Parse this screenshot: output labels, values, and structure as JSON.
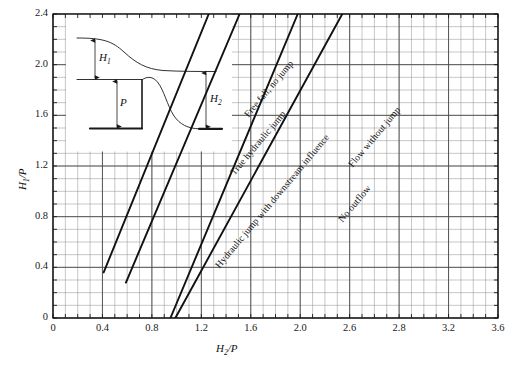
{
  "figure": {
    "background": "#ffffff",
    "line_color": "#1a1a1a",
    "major_grid_color": "#4d4d4d",
    "minor_grid_color": "#8c8c8c"
  },
  "chart_data": {
    "type": "line",
    "title": "",
    "subtitle": "",
    "xlabel": "H2/P",
    "ylabel": "H1/P",
    "xlabel_parts": {
      "base": "H",
      "sub": "2",
      "tail": "/P"
    },
    "ylabel_parts": {
      "base": "H",
      "sub": "1",
      "tail": "/P"
    },
    "xlim": [
      0,
      3.6
    ],
    "ylim": [
      0,
      2.4
    ],
    "xticks": [
      0,
      0.4,
      0.8,
      1.2,
      1.6,
      2.0,
      2.4,
      2.8,
      3.2,
      3.6
    ],
    "xticklabels": [
      "0",
      "0.4",
      "0.8",
      "1.2",
      "1.6",
      "2.0",
      "2.6",
      "2.8",
      "3.2",
      "3.6"
    ],
    "yticks": [
      0,
      0.4,
      0.8,
      1.2,
      1.6,
      2.0,
      2.4
    ],
    "yticklabels": [
      "0",
      "0.4",
      "0.8",
      "1.2",
      "1.6",
      "2.0",
      "2.4"
    ],
    "x_minor_step": 0.1,
    "y_minor_step": 0.1,
    "grid": true,
    "grid_style": "major and minor rectangular grid",
    "legend": "none (curves labelled in-place along the lines)",
    "series": [
      {
        "name": "boundary-1",
        "label_above": "Free fall, no jump",
        "points": [
          [
            0.41,
            0.36
          ],
          [
            1.26,
            2.4
          ]
        ],
        "slope": 2.4
      },
      {
        "name": "boundary-2",
        "label_above": "True hydraulic jump",
        "points": [
          [
            0.59,
            0.28
          ],
          [
            1.51,
            2.4
          ]
        ],
        "slope": 2.3
      },
      {
        "name": "boundary-3",
        "label_above": "Hydraulic jump with downstream influence",
        "points": [
          [
            0.95,
            0.0
          ],
          [
            1.98,
            2.4
          ]
        ],
        "slope": 2.33
      },
      {
        "name": "boundary-4",
        "label_above": "Flow without jump",
        "label_below": "No outflow",
        "points": [
          [
            0.99,
            0.0
          ],
          [
            2.34,
            2.4
          ]
        ],
        "slope": 1.78
      }
    ],
    "region_labels": [
      "Free fall, no jump",
      "True hydraulic jump",
      "Hydraulic jump with downstream influence",
      "Flow without jump",
      "No outflow"
    ],
    "annotations": {
      "inset": {
        "description": "Definition sketch: flow over a broad-crested weir of height P with upstream head H1 and downstream depth H2",
        "labels": [
          {
            "text": "H1",
            "base": "H",
            "sub": "1"
          },
          {
            "text": "P",
            "base": "P",
            "sub": ""
          },
          {
            "text": "H2",
            "base": "H",
            "sub": "2"
          }
        ]
      }
    }
  },
  "inset": {
    "h1_label": {
      "base": "H",
      "sub": "1"
    },
    "p_label": {
      "base": "P",
      "sub": ""
    },
    "h2_label": {
      "base": "H",
      "sub": "2"
    }
  }
}
